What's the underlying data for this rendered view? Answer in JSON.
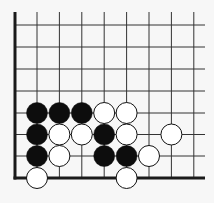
{
  "board": {
    "name": "go-board-corner",
    "colors": {
      "background": "#f7f7f7",
      "line": "#333333",
      "edge": "#1a1a1a",
      "black_stone": "#0d0d0d",
      "white_stone": "#ffffff",
      "stone_outline": "#111111"
    },
    "grid": {
      "columns_x": [
        37,
        59.4,
        81.8,
        104.2,
        126.6,
        149,
        171.4,
        193.8
      ],
      "rows_y": [
        25,
        47,
        69,
        91,
        113,
        134.5,
        156,
        178
      ],
      "left_edge_x": 15,
      "bottom_edge_y": 178,
      "top_y": 12,
      "right_x": 205
    },
    "stones": [
      {
        "color": "black",
        "col": 0,
        "row": 4
      },
      {
        "color": "black",
        "col": 1,
        "row": 4
      },
      {
        "color": "black",
        "col": 2,
        "row": 4
      },
      {
        "color": "white",
        "col": 3,
        "row": 4
      },
      {
        "color": "white",
        "col": 4,
        "row": 4
      },
      {
        "color": "black",
        "col": 0,
        "row": 5
      },
      {
        "color": "white",
        "col": 1,
        "row": 5
      },
      {
        "color": "white",
        "col": 2,
        "row": 5
      },
      {
        "color": "black",
        "col": 3,
        "row": 5
      },
      {
        "color": "white",
        "col": 4,
        "row": 5
      },
      {
        "color": "white",
        "col": 6,
        "row": 5
      },
      {
        "color": "black",
        "col": 0,
        "row": 6
      },
      {
        "color": "white",
        "col": 1,
        "row": 6
      },
      {
        "color": "black",
        "col": 3,
        "row": 6
      },
      {
        "color": "black",
        "col": 4,
        "row": 6
      },
      {
        "color": "white",
        "col": 5,
        "row": 6
      },
      {
        "color": "white",
        "col": 0,
        "row": 7
      },
      {
        "color": "white",
        "col": 4,
        "row": 7
      }
    ],
    "stone_radius": 10.5
  }
}
